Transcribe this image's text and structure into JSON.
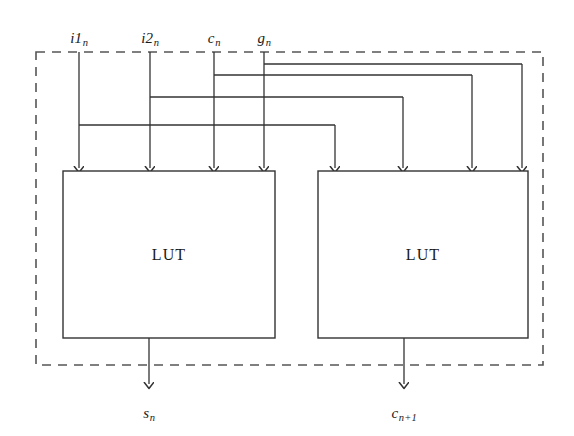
{
  "figure": {
    "kind": "circuit-schematic",
    "background_color": "#ffffff",
    "line_color": "#333333",
    "boundary_color": "#555555"
  },
  "inputs": [
    {
      "id": "i1",
      "base": "i1",
      "sub": "n",
      "label_x": 79,
      "label_y": 30,
      "drop_x": 79,
      "branch_y": 125,
      "target_x": 335
    },
    {
      "id": "i2",
      "base": "i2",
      "sub": "n",
      "label_x": 150,
      "label_y": 30,
      "drop_x": 150,
      "branch_y": 97,
      "target_x": 403
    },
    {
      "id": "c",
      "base": "c",
      "sub": "n",
      "label_x": 214,
      "label_y": 30,
      "drop_x": 214,
      "branch_y": 75,
      "target_x": 472
    },
    {
      "id": "g",
      "base": "g",
      "sub": "n",
      "label_x": 264,
      "label_y": 30,
      "drop_x": 264,
      "branch_y": 64,
      "target_x": 522
    }
  ],
  "boundary": {
    "name": "slice-boundary",
    "x": 36,
    "y": 52,
    "width": 507,
    "height": 313,
    "dash": "9 7",
    "stroke_width": 1.6
  },
  "luts": [
    {
      "id": "lut-sum",
      "label": "LUT",
      "x": 63,
      "y": 171,
      "width": 212,
      "height": 167,
      "input_arrow_x": [
        79,
        150,
        214,
        264
      ],
      "output_x": 149,
      "output_label": "s",
      "output_sub": "n"
    },
    {
      "id": "lut-carry",
      "label": "LUT",
      "x": 318,
      "y": 171,
      "width": 210,
      "height": 167,
      "input_arrow_x": [
        335,
        403,
        472,
        522
      ],
      "output_x": 404,
      "output_label": "c",
      "output_sub": "n+1"
    }
  ],
  "outputs": [
    {
      "id": "sum",
      "base": "s",
      "sub": "n",
      "x": 149,
      "label_y": 405,
      "arrow_tip_y": 384,
      "line_from_y": 338
    },
    {
      "id": "carry",
      "base": "c",
      "sub": "n+1",
      "x": 404,
      "label_y": 405,
      "arrow_tip_y": 384,
      "line_from_y": 338
    }
  ],
  "labels": {
    "input_i1": "i1",
    "input_i2": "i2",
    "input_c": "c",
    "input_g": "g",
    "sub_n": "n",
    "sub_n_plus_1": "n+1",
    "lut_left": "LUT",
    "lut_right": "LUT",
    "output_s": "s",
    "output_c": "c"
  }
}
